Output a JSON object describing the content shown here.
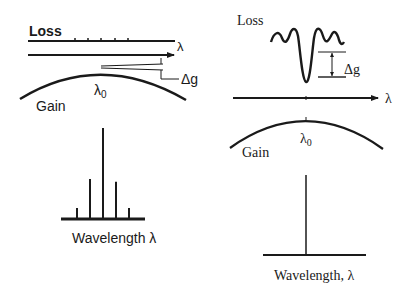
{
  "left_panel": {
    "loss_label": "Loss",
    "axis_label": "λ",
    "center_label": "λ0",
    "center_label_base": "λ",
    "center_label_sub": "0",
    "delta_label": "Δg",
    "gain_label": "Gain",
    "spectrum_xlabel": "Wavelength  λ",
    "loss_line_ticks": 5,
    "spectrum_lines": [
      {
        "name": "side-mode-2-left",
        "relative_height": 0.12
      },
      {
        "name": "side-mode-1-left",
        "relative_height": 0.44
      },
      {
        "name": "main-mode",
        "relative_height": 1.0
      },
      {
        "name": "side-mode-1-right",
        "relative_height": 0.41
      },
      {
        "name": "side-mode-2-right",
        "relative_height": 0.12
      }
    ]
  },
  "right_panel": {
    "loss_label": "Loss",
    "axis_label": "λ",
    "center_label_base": "λ",
    "center_label_sub": "0",
    "delta_label": "Δg",
    "gain_label": "Gain",
    "spectrum_xlabel": "Wavelength, λ",
    "spectrum_lines": [
      {
        "name": "single-mode",
        "relative_height": 1.0
      }
    ]
  }
}
